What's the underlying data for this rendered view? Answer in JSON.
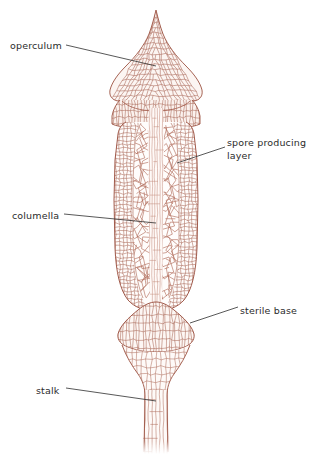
{
  "figure": {
    "background_color": "#ffffff",
    "cell_wall_color": "#a35c4b",
    "cell_wall_color_light": "#c99387",
    "cell_fill_color": "#fbf3ef",
    "leader_line_color": "#3a3a3a",
    "label_text_color": "#2b2b2b"
  },
  "labels": [
    {
      "id": "operculum",
      "text": "operculum",
      "lines": [
        "operculum"
      ],
      "x": 10,
      "y": 40,
      "leader": {
        "x1": 66,
        "y1": 45,
        "x2": 156,
        "y2": 66
      }
    },
    {
      "id": "spore-producing-layer",
      "text": "spore producing layer",
      "lines": [
        "spore producing",
        "layer"
      ],
      "x": 227,
      "y": 137,
      "leader": {
        "x1": 225,
        "y1": 147,
        "x2": 177,
        "y2": 163
      }
    },
    {
      "id": "columella",
      "text": "columella",
      "lines": [
        "columella"
      ],
      "x": 12,
      "y": 210,
      "leader": {
        "x1": 64,
        "y1": 214,
        "x2": 156,
        "y2": 223
      }
    },
    {
      "id": "sterile-base",
      "text": "sterile base",
      "lines": [
        "sterile base"
      ],
      "x": 240,
      "y": 305,
      "leader": {
        "x1": 238,
        "y1": 307,
        "x2": 190,
        "y2": 323
      }
    },
    {
      "id": "stalk",
      "text": "stalk",
      "lines": [
        "stalk"
      ],
      "x": 36,
      "y": 385,
      "leader": {
        "x1": 66,
        "y1": 388,
        "x2": 156,
        "y2": 401
      }
    }
  ],
  "structures": [
    {
      "id": "operculum",
      "name": "operculum",
      "region": "pointed cap at top of capsule"
    },
    {
      "id": "capsule",
      "name": "capsule",
      "region": "cylindrical spore case"
    },
    {
      "id": "spore-producing-layer",
      "name": "spore producing layer",
      "region": "web-like tissue between capsule wall and columella"
    },
    {
      "id": "columella",
      "name": "columella",
      "region": "central sterile column of capsule"
    },
    {
      "id": "sterile-base",
      "name": "sterile base",
      "region": "swollen apophysis below capsule"
    },
    {
      "id": "stalk",
      "name": "stalk",
      "region": "seta supporting the capsule"
    }
  ]
}
